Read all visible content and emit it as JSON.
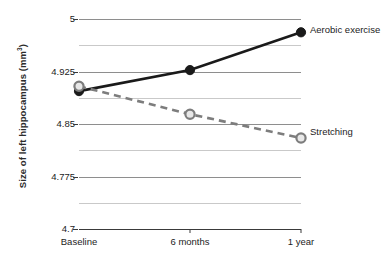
{
  "chart_data": {
    "type": "line",
    "title": "",
    "xlabel": "",
    "ylabel": "Size of left hippocampus (mm³)",
    "ylabel_text": "Size of left hippocampus (mm",
    "ylabel_sup": "3",
    "ylabel_tail": ")",
    "categories": [
      "Baseline",
      "6 months",
      "1 year"
    ],
    "ylim": [
      4.7,
      5.0
    ],
    "yticks": [
      "5",
      "4.925",
      "4.85",
      "4.775",
      "4.7"
    ],
    "ytick_values": [
      5,
      4.925,
      4.85,
      4.775,
      4.7
    ],
    "minor_ytick_values": [
      4.9625,
      4.8875,
      4.8125,
      4.7375
    ],
    "grid": true,
    "legend_position": "right-inline",
    "series": [
      {
        "name": "Aerobic exercise",
        "values": [
          4.897,
          4.927,
          4.981
        ],
        "color": "#1a1a1a",
        "marker": "filled-circle",
        "marker_fill": "#1a1a1a",
        "marker_stroke": "#1a1a1a",
        "line_style": "solid",
        "line_width": 2.6,
        "label_y": 24
      },
      {
        "name": "Stretching",
        "values": [
          4.904,
          4.864,
          4.83
        ],
        "color": "#7d7d7d",
        "marker": "open-circle",
        "marker_fill": "#e8e8e8",
        "marker_stroke": "#7d7d7d",
        "line_style": "dashed",
        "line_width": 2.6,
        "label_y": 126
      }
    ]
  },
  "axis": {
    "axis_color": "#3a3a3a",
    "grid_major_color": "#8e8e8e",
    "grid_minor_color": "#c9c9c9"
  }
}
